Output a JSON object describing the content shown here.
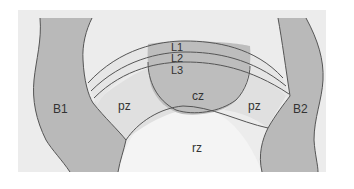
{
  "diagram": {
    "type": "schematic",
    "colors": {
      "page_background": "#ffffff",
      "panel_background": "#ececec",
      "column_fill": "#b9b9b9",
      "central_zone_fill": "#bdbdbd",
      "peripheral_zone_fill": "#e0e0e0",
      "rib_zone_fill": "#f4f4f4",
      "layer_band_fill": "#e6e6e6",
      "outline": "#555555"
    },
    "labels": {
      "b1": "B1",
      "b2": "B2",
      "l1": "L1",
      "l2": "L2",
      "l3": "L3",
      "cz": "cz",
      "pz_left": "pz",
      "pz_right": "pz",
      "rz": "rz"
    },
    "regions": [
      {
        "id": "B1",
        "description": "left column"
      },
      {
        "id": "B2",
        "description": "right column"
      },
      {
        "id": "L1",
        "description": "outer layer band"
      },
      {
        "id": "L2",
        "description": "middle layer band"
      },
      {
        "id": "L3",
        "description": "inner layer band"
      },
      {
        "id": "cz",
        "description": "central zone"
      },
      {
        "id": "pz",
        "description": "peripheral zone (left and right)"
      },
      {
        "id": "rz",
        "description": "rib zone"
      }
    ]
  }
}
